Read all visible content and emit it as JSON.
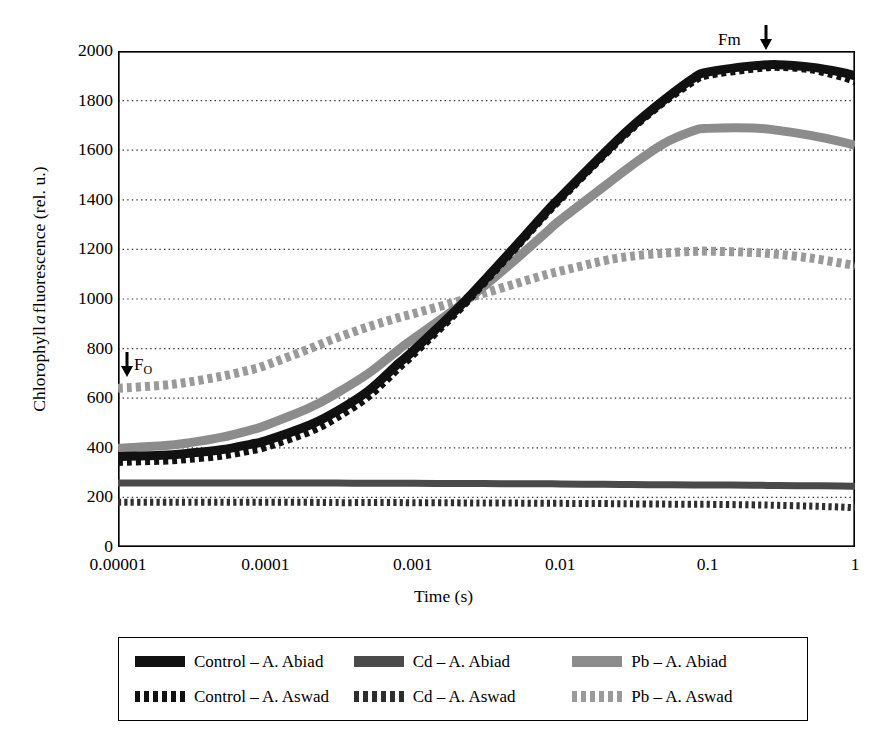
{
  "figure": {
    "ylabel_pre": "Chlorophyll ",
    "ylabel_ital": "a",
    "ylabel_post": " fluorescence (rel. u.)",
    "xlabel": "Time (s)"
  },
  "annotations": {
    "fm": "Fm",
    "fo_base": "F",
    "fo_sub": "O",
    "arrow_glyph": "↓"
  },
  "legend": {
    "items": [
      {
        "label": "Control – A. Abiad",
        "style": "solid",
        "color": "#111111"
      },
      {
        "label": "Cd – A. Abiad",
        "style": "solid",
        "color": "#4a4a4a"
      },
      {
        "label": "Pb – A. Abiad",
        "style": "solid",
        "color": "#8c8c8c"
      },
      {
        "label": "Control – A. Aswad",
        "style": "dash",
        "color": "#111111"
      },
      {
        "label": "Cd – A. Aswad",
        "style": "dash",
        "color": "#2e2e2e"
      },
      {
        "label": "Pb – A. Aswad",
        "style": "dash",
        "color": "#9a9a9a"
      }
    ]
  },
  "chart_data": {
    "type": "line",
    "title": "",
    "xlabel": "Time (s)",
    "ylabel": "Chlorophyll a fluorescence (rel. u.)",
    "xscale": "log",
    "xlim": [
      1e-05,
      1
    ],
    "ylim": [
      0,
      2000
    ],
    "xticks": [
      1e-05,
      0.0001,
      0.001,
      0.01,
      0.1,
      1
    ],
    "xticklabels": [
      "0.00001",
      "0.0001",
      "0.001",
      "0.01",
      "0.1",
      "1"
    ],
    "yticks": [
      0,
      200,
      400,
      600,
      800,
      1000,
      1200,
      1400,
      1600,
      1800,
      2000
    ],
    "grid": "horizontal-dotted",
    "legend_position": "below-plot",
    "annotations": [
      {
        "text": "Fm",
        "x": 0.3,
        "y": 2000,
        "arrow": "down"
      },
      {
        "text": "FO",
        "x": 1e-05,
        "y": 700,
        "arrow": "down"
      }
    ],
    "x": [
      1e-05,
      2e-05,
      3e-05,
      5e-05,
      8e-05,
      0.0001,
      0.0002,
      0.0003,
      0.0005,
      0.0008,
      0.001,
      0.002,
      0.003,
      0.005,
      0.008,
      0.01,
      0.02,
      0.03,
      0.05,
      0.08,
      0.1,
      0.2,
      0.3,
      0.5,
      0.8,
      1.0
    ],
    "series": [
      {
        "name": "Control – A. Abiad",
        "style": "solid",
        "color": "#111111",
        "values": [
          365,
          370,
          378,
          392,
          415,
          428,
          492,
          545,
          630,
          740,
          790,
          960,
          1070,
          1215,
          1350,
          1410,
          1590,
          1690,
          1800,
          1890,
          1915,
          1940,
          1945,
          1935,
          1915,
          1900
        ]
      },
      {
        "name": "Control – A. Aswad",
        "style": "dash",
        "color": "#111111",
        "values": [
          345,
          350,
          357,
          370,
          392,
          405,
          468,
          522,
          610,
          725,
          778,
          952,
          1065,
          1210,
          1345,
          1405,
          1585,
          1685,
          1795,
          1880,
          1905,
          1930,
          1938,
          1928,
          1900,
          1880
        ]
      },
      {
        "name": "Pb – A. Abiad",
        "style": "solid",
        "color": "#8c8c8c",
        "values": [
          398,
          408,
          420,
          442,
          472,
          490,
          562,
          618,
          700,
          795,
          838,
          965,
          1048,
          1160,
          1268,
          1318,
          1455,
          1535,
          1625,
          1678,
          1688,
          1690,
          1680,
          1660,
          1635,
          1620
        ]
      },
      {
        "name": "Pb – A. Aswad",
        "style": "dash",
        "color": "#9a9a9a",
        "values": [
          640,
          652,
          665,
          688,
          715,
          732,
          800,
          842,
          888,
          925,
          940,
          990,
          1022,
          1062,
          1098,
          1112,
          1155,
          1172,
          1185,
          1192,
          1193,
          1188,
          1180,
          1165,
          1145,
          1135
        ]
      },
      {
        "name": "Cd – A. Abiad",
        "style": "solid",
        "color": "#4a4a4a",
        "values": [
          258,
          258,
          258,
          258,
          258,
          258,
          258,
          258,
          257,
          257,
          257,
          256,
          256,
          255,
          255,
          254,
          253,
          252,
          251,
          250,
          250,
          249,
          248,
          247,
          246,
          245
        ]
      },
      {
        "name": "Cd – A. Aswad",
        "style": "dash",
        "color": "#2e2e2e",
        "values": [
          180,
          180,
          180,
          180,
          180,
          180,
          180,
          179,
          179,
          179,
          178,
          178,
          177,
          177,
          176,
          176,
          175,
          174,
          173,
          172,
          172,
          170,
          168,
          165,
          161,
          158
        ]
      }
    ]
  }
}
